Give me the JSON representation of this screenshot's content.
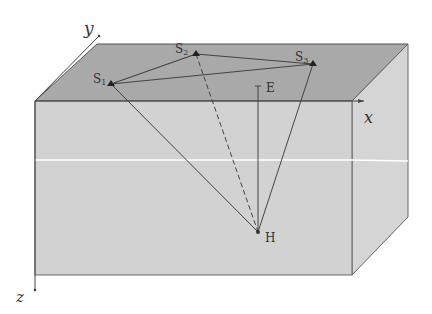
{
  "diagram": {
    "type": "3d-block-geometry",
    "colors": {
      "background": "#ffffff",
      "top_face": "#a9a9a9",
      "front_face": "#d2d2d2",
      "side_face": "#d5d5d5",
      "edge": "#555555",
      "ray_line": "#444444",
      "layer_line": "#ffffff"
    },
    "axes": {
      "x": "x",
      "y": "y",
      "z": "z"
    },
    "points": {
      "s1": {
        "label": "S",
        "sub": "1"
      },
      "s2": {
        "label": "S",
        "sub": "2"
      },
      "s3": {
        "label": "S",
        "sub": "3"
      },
      "e": {
        "label": "E"
      },
      "h": {
        "label": "H"
      }
    },
    "connections": [
      {
        "from": "S1",
        "to": "S2",
        "style": "solid"
      },
      {
        "from": "S2",
        "to": "S3",
        "style": "solid"
      },
      {
        "from": "S1",
        "to": "S3",
        "style": "solid"
      },
      {
        "from": "S1",
        "to": "H",
        "style": "solid"
      },
      {
        "from": "S2",
        "to": "H",
        "style": "dashed"
      },
      {
        "from": "S3",
        "to": "H",
        "style": "solid"
      },
      {
        "from": "E",
        "to": "H",
        "style": "solid"
      }
    ]
  }
}
